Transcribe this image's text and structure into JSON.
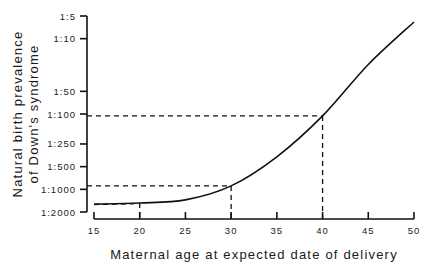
{
  "chart_data": {
    "type": "line",
    "title": "",
    "xlabel": "Maternal age at expected date of delivery",
    "ylabel_lines": [
      "Natural birth prevalence",
      "of Down's syndrome"
    ],
    "ylabel": "Natural birth prevalence of Down's syndrome",
    "x_ticks": [
      15,
      20,
      25,
      30,
      35,
      40,
      45,
      50
    ],
    "xlim": [
      15,
      50
    ],
    "y_scale": "log (odds 1:N)",
    "y_ticks": [
      {
        "label": "1:5",
        "n": 5
      },
      {
        "label": "1:10",
        "n": 10
      },
      {
        "label": "1:50",
        "n": 50
      },
      {
        "label": "1:100",
        "n": 100
      },
      {
        "label": "1:250",
        "n": 250
      },
      {
        "label": "1:500",
        "n": 500
      },
      {
        "label": "1:1000",
        "n": 1000
      },
      {
        "label": "1:2000",
        "n": 2000
      }
    ],
    "ylim_n": [
      2000,
      5
    ],
    "grid": false,
    "legend": null,
    "series": [
      {
        "name": "Prevalence",
        "x": [
          15,
          20,
          25,
          30,
          35,
          40,
          45,
          50
        ],
        "values_1_in_n": [
          1570,
          1520,
          1380,
          900,
          370,
          106,
          22,
          6
        ]
      }
    ],
    "annotations": [
      {
        "type": "dashed-reference",
        "x": 20,
        "y_n": 1520,
        "note": "vertical dashed drop at age 20"
      },
      {
        "type": "dashed-reference",
        "x": 30,
        "y_n": 900,
        "note": "dashed lines from age 30 to approx 1:900"
      },
      {
        "type": "dashed-reference",
        "x": 40,
        "y_n": 106,
        "note": "dashed lines from age 40 to approx 1:100"
      }
    ]
  }
}
